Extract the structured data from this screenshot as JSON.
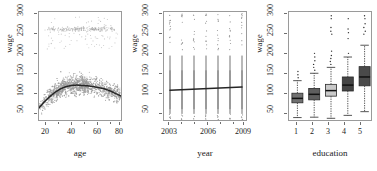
{
  "figure": {
    "panels": [
      {
        "id": "age-panel",
        "xlabel": "age",
        "ylabel": "wage",
        "xticks": [
          "20",
          "40",
          "60",
          "80"
        ],
        "yticks": [
          "50",
          "100",
          "150",
          "200",
          "250",
          "300"
        ]
      },
      {
        "id": "year-panel",
        "xlabel": "year",
        "ylabel": "wage",
        "xticks": [
          "2003",
          "2006",
          "2009"
        ],
        "yticks": [
          "50",
          "100",
          "150",
          "200",
          "250",
          "300"
        ]
      },
      {
        "id": "education-panel",
        "xlabel": "education",
        "ylabel": "wage",
        "xticks": [
          "1",
          "2",
          "3",
          "4",
          "5"
        ],
        "yticks": [
          "50",
          "100",
          "150",
          "200",
          "250",
          "300"
        ]
      }
    ]
  },
  "chart_data": [
    {
      "type": "scatter",
      "title": "",
      "xlabel": "age",
      "ylabel": "wage",
      "xlim": [
        18,
        80
      ],
      "ylim": [
        20,
        318
      ],
      "xticks": [
        20,
        40,
        60,
        80
      ],
      "yticks": [
        50,
        100,
        150,
        200,
        250,
        300
      ],
      "grid": false,
      "legend": "none",
      "point_color": "#9b9b9b",
      "description": "Dense grey scatter of wage vs age with a separate high-wage cluster near 270-300; black smooth fit overlaid.",
      "series": [
        {
          "name": "wage vs age (scatter cloud)",
          "note": "approximately 3000 points, main mass 50-160, secondary band 250-300"
        },
        {
          "name": "smooth fit",
          "color": "#262626",
          "x": [
            18,
            22,
            26,
            30,
            34,
            38,
            42,
            46,
            50,
            54,
            58,
            62,
            66,
            70,
            74,
            80
          ],
          "y": [
            58,
            75,
            89,
            101,
            110,
            116,
            119,
            120,
            119,
            118,
            116,
            113,
            110,
            105,
            98,
            88
          ]
        }
      ]
    },
    {
      "type": "scatter",
      "title": "",
      "xlabel": "year",
      "ylabel": "wage",
      "xlim": [
        2002.5,
        2009.5
      ],
      "ylim": [
        20,
        318
      ],
      "xticks": [
        2003,
        2006,
        2009
      ],
      "yticks": [
        50,
        100,
        150,
        200,
        250,
        300
      ],
      "grid": false,
      "legend": "none",
      "point_color": "#a6a6a6",
      "description": "Vertical strips of wage values for each year 2003-2009 with a nearly flat, slightly increasing linear fit.",
      "categories": [
        2003,
        2004,
        2005,
        2006,
        2007,
        2008,
        2009
      ],
      "series": [
        {
          "name": "linear fit",
          "color": "#262626",
          "x": [
            2003,
            2009
          ],
          "y": [
            106,
            115
          ]
        }
      ]
    },
    {
      "type": "box",
      "title": "",
      "xlabel": "education",
      "ylabel": "wage",
      "ylim": [
        20,
        318
      ],
      "xticks": [
        1,
        2,
        3,
        4,
        5
      ],
      "yticks": [
        50,
        100,
        150,
        200,
        250,
        300
      ],
      "grid": false,
      "legend": "none",
      "categories": [
        "1",
        "2",
        "3",
        "4",
        "5"
      ],
      "boxes": [
        {
          "category": "1",
          "whisker_low": 32,
          "q1": 72,
          "median": 84,
          "q3": 98,
          "whisker_high": 132,
          "fill": "#707070",
          "outliers": [
            140,
            148,
            157
          ]
        },
        {
          "category": "2",
          "whisker_low": 33,
          "q1": 80,
          "median": 95,
          "q3": 111,
          "whisker_high": 152,
          "fill": "#5e5e5e",
          "outliers": [
            160,
            168,
            176,
            186,
            196,
            206
          ]
        },
        {
          "category": "3",
          "whisker_low": 30,
          "q1": 90,
          "median": 105,
          "q3": 122,
          "whisker_high": 168,
          "fill": "#c9c9c9",
          "outliers": [
            176,
            184,
            192,
            200,
            212,
            258,
            266,
            276,
            300,
            308
          ]
        },
        {
          "category": "4",
          "whisker_low": 38,
          "q1": 104,
          "median": 120,
          "q3": 142,
          "whisker_high": 196,
          "fill": "#454545",
          "outliers": [
            206,
            246,
            262,
            272,
            300
          ]
        },
        {
          "category": "5",
          "whisker_low": 48,
          "q1": 118,
          "median": 142,
          "q3": 170,
          "whisker_high": 228,
          "fill": "#4a4a4a",
          "outliers": [
            258,
            266,
            276,
            286,
            300,
            308
          ]
        }
      ]
    }
  ]
}
